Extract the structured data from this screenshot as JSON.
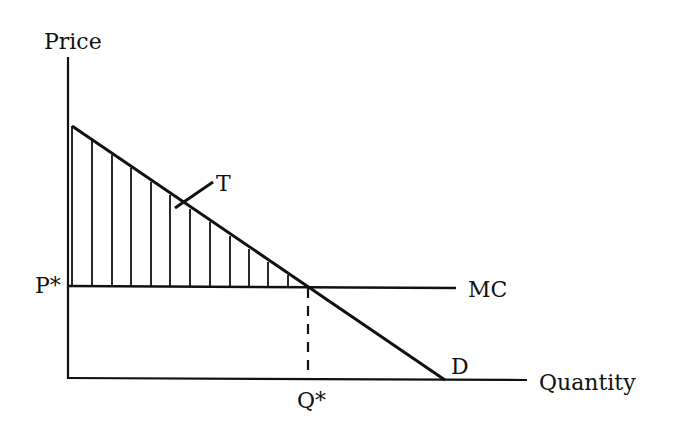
{
  "diagram": {
    "type": "economics-supply-demand",
    "axes": {
      "y_label": "Price",
      "x_label": "Quantity"
    },
    "curves": {
      "marginal_cost_label": "MC",
      "demand_label": "D"
    },
    "equilibrium": {
      "price_label": "P*",
      "quantity_label": "Q*"
    },
    "area": {
      "label": "T",
      "shading": "vertical-hatch",
      "description": "Triangle between demand curve and MC line, left of Q*"
    },
    "colors": {
      "ink": "#111111",
      "background": "#ffffff"
    }
  }
}
